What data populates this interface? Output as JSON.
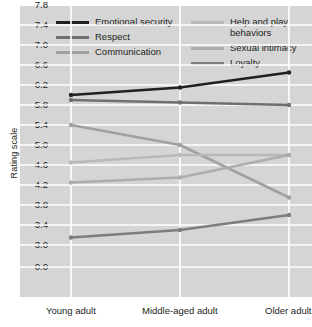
{
  "chart_data": {
    "type": "line",
    "title": "",
    "xlabel": "",
    "ylabel": "Rating scale",
    "categories": [
      "Young adult",
      "Middle-aged adult",
      "Older adult"
    ],
    "ylim": [
      3.0,
      7.8
    ],
    "yticks": [
      "7.8",
      "7.4",
      "7.0",
      "6.6",
      "6.2",
      "5.8",
      "5.4",
      "5.0",
      "4.6",
      "4.2",
      "3.8",
      "3.4",
      "3.0",
      "0.0"
    ],
    "ytick_values": [
      7.8,
      7.4,
      7.0,
      6.6,
      6.2,
      5.8,
      5.4,
      5.0,
      4.6,
      4.2,
      3.8,
      3.4,
      3.0,
      0.0
    ],
    "axis_break": true,
    "axis_break_note": "y-axis is broken between 3.0 and 0.0",
    "grid": true,
    "grid_color": "#ffffff",
    "plot_background": "#d5d5d5",
    "legend_position": "top",
    "legend_columns": 2,
    "series": [
      {
        "name": "Emotional security",
        "values": [
          6.0,
          6.15,
          6.45
        ],
        "color": "#231f20"
      },
      {
        "name": "Respect",
        "values": [
          5.9,
          5.85,
          5.8
        ],
        "color": "#6f6f6f"
      },
      {
        "name": "Communication",
        "values": [
          5.4,
          5.0,
          3.95
        ],
        "color": "#a0a0a0"
      },
      {
        "name": "Help and play behaviors",
        "values": [
          4.65,
          4.8,
          4.8
        ],
        "color": "#b9b9b9"
      },
      {
        "name": "Sexual intimacy",
        "values": [
          4.25,
          4.35,
          4.8
        ],
        "color": "#adadad"
      },
      {
        "name": "Loyalty",
        "values": [
          3.15,
          3.3,
          3.6
        ],
        "color": "#7d7d7d"
      }
    ]
  },
  "legend": {
    "column1": [
      {
        "label": "Emotional security",
        "color": "#231f20"
      },
      {
        "label": "Respect",
        "color": "#6f6f6f"
      },
      {
        "label": "Communication",
        "color": "#a0a0a0"
      }
    ],
    "column2": [
      {
        "label": "Help and play behaviors",
        "color": "#b9b9b9"
      },
      {
        "label": "Sexual intimacy",
        "color": "#adadad"
      },
      {
        "label": "Loyalty",
        "color": "#7d7d7d"
      }
    ]
  }
}
